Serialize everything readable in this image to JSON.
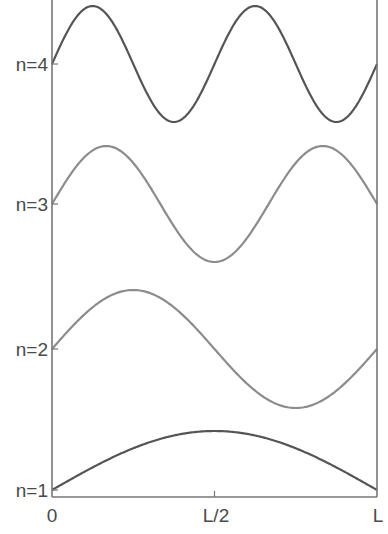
{
  "chart_data": {
    "type": "line",
    "title": "",
    "xlabel": "",
    "ylabel": "",
    "x_ticks": [
      "0",
      "L/2",
      "L"
    ],
    "x_range": [
      0,
      1
    ],
    "grid": false,
    "legend": "none",
    "series": [
      {
        "name": "n=1",
        "mode": 1,
        "baseline_label": "n=1",
        "color": "#555555",
        "function": "sin(1*pi*x/L)",
        "amplitude": 1
      },
      {
        "name": "n=2",
        "mode": 2,
        "baseline_label": "n=2",
        "color": "#8c8c8c",
        "function": "sin(2*pi*x/L)",
        "amplitude": 1
      },
      {
        "name": "n=3",
        "mode": 3,
        "baseline_label": "n=3",
        "color": "#8c8c8c",
        "function": "sin(3*pi*x/L)",
        "amplitude": 1
      },
      {
        "name": "n=4",
        "mode": 4,
        "baseline_label": "n=4",
        "color": "#555555",
        "function": "sin(4*pi*x/L)",
        "amplitude": 1
      }
    ],
    "annotations": [
      "Standing wave modes offset vertically; n=1 at bottom, n=4 at top"
    ]
  },
  "layout": {
    "plot_left": 52,
    "plot_right": 377,
    "plot_bottom": 497,
    "baselines": {
      "1": 490,
      "2": 349,
      "3": 204,
      "4": 64
    },
    "amplitude_px": {
      "1": 59,
      "2": 59,
      "3": 58,
      "4": 58
    },
    "axis_color": "#777777"
  },
  "labels": {
    "y_n1": "n=1",
    "y_n2": "n=2",
    "y_n3": "n=3",
    "y_n4": "n=4",
    "x_0": "0",
    "x_mid": "L/2",
    "x_end": "L"
  }
}
